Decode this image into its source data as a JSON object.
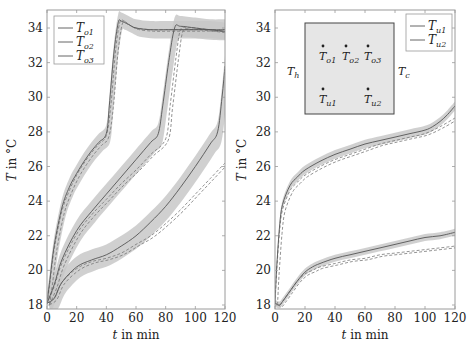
{
  "chart_data": [
    {
      "type": "line",
      "panel": "left",
      "title": "",
      "xlabel": "t in min",
      "ylabel": "T in °C",
      "xlim": [
        0,
        120
      ],
      "ylim": [
        17.8,
        35
      ],
      "xticks": [
        0,
        20,
        40,
        60,
        80,
        100,
        120
      ],
      "yticks": [
        18,
        20,
        22,
        24,
        26,
        28,
        30,
        32,
        34
      ],
      "grid": false,
      "legend_position": "upper left",
      "legend": [
        "T_o1",
        "T_o2",
        "T_o3"
      ],
      "annotation": "Solid lines: measured; dashed/marked lines: simulated; grey bands: uncertainty",
      "series": [
        {
          "name": "T_o1",
          "x": [
            0,
            2,
            5,
            10,
            15,
            20,
            25,
            30,
            35,
            40,
            42,
            45,
            48,
            50,
            55,
            60,
            70,
            80,
            90,
            100,
            110,
            120
          ],
          "y": [
            18.1,
            19.5,
            21.5,
            23.6,
            24.8,
            25.6,
            26.3,
            26.9,
            27.4,
            27.9,
            29.5,
            32.5,
            34.3,
            34.4,
            34.2,
            34.0,
            33.9,
            33.9,
            33.9,
            33.9,
            33.9,
            33.8
          ],
          "band": 0.5
        },
        {
          "name": "T_o2",
          "x": [
            0,
            5,
            10,
            20,
            30,
            40,
            50,
            60,
            70,
            75,
            78,
            82,
            86,
            90,
            100,
            110,
            120
          ],
          "y": [
            18.1,
            19.2,
            20.6,
            22.3,
            23.4,
            24.4,
            25.4,
            26.4,
            27.4,
            27.9,
            29.5,
            32.0,
            34.0,
            34.1,
            34.0,
            33.9,
            33.9
          ],
          "band": 0.6
        },
        {
          "name": "T_o3",
          "x": [
            0,
            5,
            10,
            20,
            30,
            40,
            50,
            60,
            70,
            80,
            90,
            100,
            110,
            115,
            118,
            120
          ],
          "y": [
            18.1,
            18.4,
            19.3,
            20.2,
            20.6,
            20.9,
            21.4,
            22.0,
            22.8,
            23.7,
            24.8,
            26.0,
            27.3,
            28.0,
            30.0,
            31.8
          ],
          "band": 0.6
        },
        {
          "name": "T_o1 sim",
          "x": [
            0,
            2,
            5,
            10,
            15,
            20,
            25,
            30,
            35,
            40,
            43,
            46,
            49,
            52,
            55,
            60,
            70,
            80,
            90,
            100,
            110,
            120
          ],
          "y": [
            18.1,
            19.3,
            21.3,
            23.4,
            24.6,
            25.5,
            26.2,
            26.8,
            27.3,
            27.8,
            29.5,
            32.5,
            34.3,
            34.4,
            34.2,
            34.0,
            33.9,
            33.9,
            33.9,
            33.9,
            33.9,
            33.8
          ]
        },
        {
          "name": "T_o2 sim",
          "x": [
            0,
            5,
            10,
            20,
            30,
            40,
            50,
            60,
            70,
            80,
            83,
            87,
            90,
            95,
            100,
            110,
            120
          ],
          "y": [
            18.1,
            19.1,
            20.4,
            22.1,
            23.2,
            24.1,
            25.0,
            25.8,
            26.7,
            27.6,
            29.5,
            32.3,
            33.9,
            34.0,
            34.0,
            33.9,
            33.9
          ]
        },
        {
          "name": "T_o3 sim",
          "x": [
            0,
            5,
            10,
            20,
            30,
            40,
            50,
            60,
            70,
            80,
            90,
            100,
            110,
            120
          ],
          "y": [
            18.1,
            18.4,
            19.3,
            20.1,
            20.5,
            20.7,
            21.0,
            21.5,
            22.0,
            22.7,
            23.5,
            24.4,
            25.3,
            26.2
          ]
        }
      ]
    },
    {
      "type": "line",
      "panel": "right",
      "title": "",
      "xlabel": "t in min",
      "ylabel": "T in °C",
      "xlim": [
        0,
        120
      ],
      "ylim": [
        17.8,
        35
      ],
      "xticks": [
        0,
        20,
        40,
        60,
        80,
        100,
        120
      ],
      "yticks": [
        18,
        20,
        22,
        24,
        26,
        28,
        30,
        32,
        34
      ],
      "grid": false,
      "legend_position": "upper right",
      "legend": [
        "T_u1",
        "T_u2"
      ],
      "inset": {
        "labels_left": "T_h",
        "labels_right": "T_c",
        "sensors": [
          "T_o1",
          "T_o2",
          "T_o3",
          "T_u1",
          "T_u2"
        ]
      },
      "series": [
        {
          "name": "T_u1",
          "x": [
            0,
            1,
            3,
            5,
            10,
            15,
            20,
            30,
            40,
            50,
            60,
            70,
            80,
            90,
            100,
            105,
            110,
            115,
            120
          ],
          "y": [
            18.1,
            20.0,
            22.5,
            23.8,
            24.9,
            25.4,
            25.8,
            26.3,
            26.7,
            27.0,
            27.3,
            27.5,
            27.7,
            27.9,
            28.1,
            28.3,
            28.6,
            29.0,
            29.5
          ],
          "band": 0.25
        },
        {
          "name": "T_u2",
          "x": [
            0,
            3,
            5,
            10,
            15,
            20,
            25,
            30,
            40,
            50,
            60,
            70,
            80,
            90,
            100,
            110,
            120
          ],
          "y": [
            18.1,
            18.0,
            18.2,
            18.8,
            19.4,
            19.9,
            20.2,
            20.4,
            20.7,
            20.9,
            21.1,
            21.3,
            21.5,
            21.7,
            21.9,
            22.0,
            22.2
          ],
          "band": 0.2
        },
        {
          "name": "T_u1 sim",
          "x": [
            0,
            1,
            3,
            5,
            10,
            15,
            20,
            30,
            40,
            50,
            60,
            70,
            80,
            90,
            100,
            110,
            120
          ],
          "y": [
            18.1,
            19.8,
            22.2,
            23.5,
            24.6,
            25.1,
            25.5,
            26.0,
            26.4,
            26.7,
            27.0,
            27.3,
            27.5,
            27.7,
            27.9,
            28.3,
            28.8
          ]
        },
        {
          "name": "T_u2 sim",
          "x": [
            0,
            3,
            5,
            10,
            15,
            20,
            25,
            30,
            40,
            50,
            60,
            70,
            80,
            90,
            100,
            110,
            120
          ],
          "y": [
            18.1,
            18.0,
            18.2,
            18.8,
            19.4,
            19.8,
            20.0,
            20.2,
            20.4,
            20.6,
            20.7,
            20.9,
            21.0,
            21.1,
            21.2,
            21.3,
            21.4
          ]
        }
      ]
    }
  ],
  "labels": {
    "xlabel": "t in min",
    "ylabel_T": "T",
    "ylabel_rest": "in °C",
    "legend_left": [
      {
        "main": "T",
        "sub": "o1"
      },
      {
        "main": "T",
        "sub": "o2"
      },
      {
        "main": "T",
        "sub": "o3"
      }
    ],
    "legend_right": [
      {
        "main": "T",
        "sub": "u1"
      },
      {
        "main": "T",
        "sub": "u2"
      }
    ],
    "inset_th": {
      "main": "T",
      "sub": "h"
    },
    "inset_tc": {
      "main": "T",
      "sub": "c"
    }
  },
  "colors": {
    "band": "#c8c8c8",
    "line": "#555555",
    "sim": "#777777",
    "axis": "#9a9a9a",
    "inset_fill": "#e6e6e6"
  }
}
